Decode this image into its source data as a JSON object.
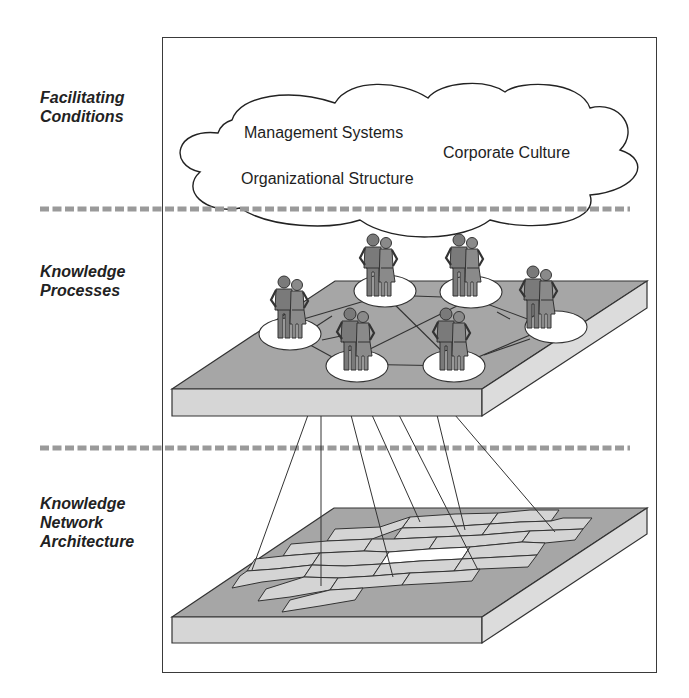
{
  "diagram": {
    "layers": [
      {
        "id": "facilitating",
        "label": "Facilitating\nConditions",
        "items": [
          "Management Systems",
          "Corporate Culture",
          "Organizational Structure"
        ]
      },
      {
        "id": "processes",
        "label": "Knowledge\nProcesses",
        "groups_count": 6
      },
      {
        "id": "architecture",
        "label": "Knowledge\nNetwork\nArchitecture"
      }
    ],
    "colors": {
      "frame": "#3a3a3a",
      "separator": "#9a9a9a",
      "platform_top": "#a6a6a6",
      "platform_side": "#d6d6d6",
      "hex_fill": "#d4d4d4",
      "hex_center": "#ffffff",
      "person_fill": "#7a7a7a",
      "node_fill": "#ffffff"
    }
  }
}
